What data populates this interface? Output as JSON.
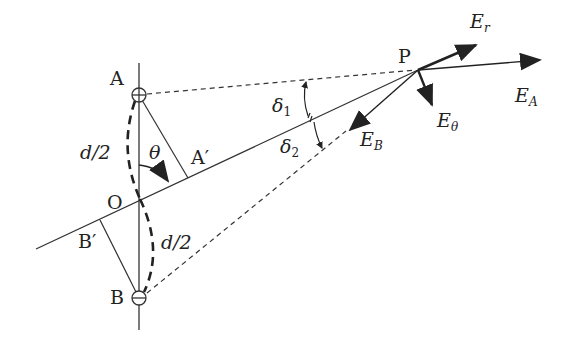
{
  "diagram": {
    "type": "electric dipole field geometry",
    "points": {
      "A": "A",
      "A_prime": "A′",
      "O": "O",
      "B": "B",
      "B_prime": "B′",
      "P": "P"
    },
    "charges": {
      "A": "+",
      "B": "−"
    },
    "labels": {
      "half_distance_top": "d/2",
      "half_distance_bottom": "d/2",
      "theta": "θ",
      "delta1_base": "δ",
      "delta1_sub": "1",
      "delta2_base": "δ",
      "delta2_sub": "2"
    },
    "vectors": {
      "Er": {
        "base": "E",
        "sub": "r"
      },
      "EA": {
        "base": "E",
        "sub": "A"
      },
      "Etheta": {
        "base": "E",
        "sub": "θ"
      },
      "EB": {
        "base": "E",
        "sub": "B"
      }
    },
    "colors": {
      "line": "#333333",
      "background": "#ffffff"
    }
  }
}
